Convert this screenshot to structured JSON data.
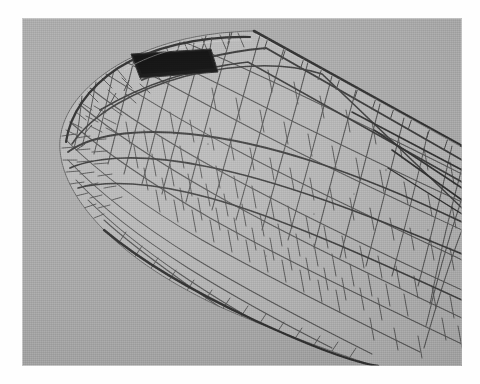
{
  "image": {
    "subject": "dragonfly-wing-apex",
    "description": "Grayscale macro photograph of the apical half of a dragonfly (Odonata) forewing showing dense polygonal cell venation, the dark pterostigma along the leading edge, and the rounded wing apex at left.",
    "medium": "black-and-white photograph on white page",
    "orientation": "wing apex at left, wing base at right",
    "plate": {
      "left_px": 22,
      "top_px": 18,
      "width_px": 440,
      "height_px": 348
    },
    "colors": {
      "page": "#fefefe",
      "background_gray": "#a9a9a9",
      "membrane_gray": "#b2b2b2",
      "vein_dark": "#3a3a3a",
      "vein_mid": "#5e5e5e",
      "pterostigma_black": "#111111",
      "highlight": "#d2d2d2"
    },
    "features": [
      {
        "name": "pterostigma",
        "label": "pterostigma",
        "note": "dark elongated cell on the anterior margin near the apex"
      },
      {
        "name": "costal-margin",
        "label": "costal margin",
        "note": "thick leading-edge vein running from upper-left to lower-right"
      },
      {
        "name": "wing-apex",
        "label": "wing apex",
        "note": "rounded tip at the left of the frame"
      },
      {
        "name": "posterior-margin",
        "label": "posterior margin",
        "note": "smooth trailing edge descending to the lower right"
      },
      {
        "name": "longitudinal-veins",
        "label": "longitudinal veins",
        "note": "major veins converging toward the wing base at right"
      },
      {
        "name": "cross-veins",
        "label": "cross veins",
        "note": "fine veins subdividing the membrane into irregular polygonal cells"
      },
      {
        "name": "marginal-cells",
        "label": "marginal cells",
        "note": "small rectangular cells in a row just inside the costal margin"
      },
      {
        "name": "background",
        "label": "plain gray backdrop"
      }
    ]
  }
}
